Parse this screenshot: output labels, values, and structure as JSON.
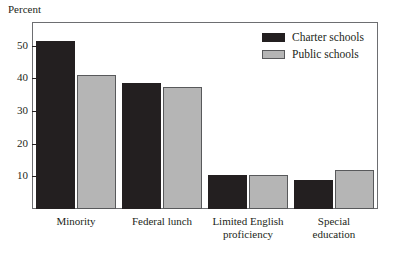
{
  "chart_data": {
    "type": "bar",
    "title": "",
    "xlabel": "",
    "ylabel": "Percent",
    "ylim": [
      0,
      57
    ],
    "yticks": [
      10,
      20,
      30,
      40,
      50
    ],
    "ytick_labels": [
      "10",
      "20",
      "30",
      "40",
      "50"
    ],
    "grid": false,
    "legend_position": "top-right",
    "categories": [
      "Minority",
      "Federal lunch",
      "Limited English\nproficiency",
      "Special\neducation"
    ],
    "series": [
      {
        "name": "Charter schools",
        "color": "#231f20",
        "values": [
          51.5,
          38.5,
          10.5,
          9
        ]
      },
      {
        "name": "Public schools",
        "color": "#b5b5b5",
        "values": [
          41,
          37.5,
          10.5,
          12
        ]
      }
    ]
  },
  "legend": {
    "items": [
      {
        "label": "Charter schools",
        "swatch": "charter"
      },
      {
        "label": "Public schools",
        "swatch": "public"
      }
    ]
  }
}
